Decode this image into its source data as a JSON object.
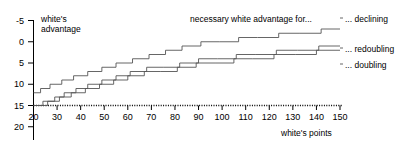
{
  "chart_data": {
    "type": "line",
    "title": "necessary white advantage for...",
    "xlabel": "white's points",
    "ylabel": "white's advantage",
    "xlim": [
      20,
      150
    ],
    "ylim": [
      -5,
      20
    ],
    "grid": false,
    "legend_position": "right",
    "xticks": [
      20,
      30,
      40,
      50,
      60,
      70,
      80,
      90,
      100,
      110,
      120,
      130,
      140,
      150
    ],
    "yticks": [
      -5,
      0,
      5,
      10,
      15,
      20
    ],
    "step_style": "post",
    "series": [
      {
        "name": "... declining",
        "color": "#555555",
        "x": [
          20,
          23,
          27,
          32,
          37,
          43,
          49,
          55,
          62,
          69,
          76,
          83,
          91,
          99,
          107,
          115,
          124,
          133,
          142,
          150
        ],
        "values": [
          3,
          4,
          5,
          6,
          7,
          8,
          9,
          10,
          11,
          12,
          13,
          14,
          15,
          15,
          16,
          16,
          17,
          17,
          18,
          18
        ]
      },
      {
        "name": "... redoubling",
        "color": "#555555",
        "x": [
          20,
          24,
          29,
          33,
          38,
          43,
          49,
          55,
          61,
          68,
          75,
          82,
          90,
          98,
          106,
          114,
          123,
          132,
          141,
          150
        ],
        "values": [
          0,
          1,
          2,
          3,
          4,
          5,
          6,
          7,
          8,
          9,
          9,
          10,
          11,
          11,
          12,
          12,
          13,
          13,
          14,
          14
        ]
      },
      {
        "name": "... doubling",
        "color": "#555555",
        "x": [
          20,
          26,
          31,
          36,
          42,
          48,
          54,
          60,
          67,
          74,
          81,
          89,
          97,
          105,
          113,
          122,
          131,
          140,
          150
        ],
        "values": [
          0,
          1,
          2,
          3,
          4,
          5,
          6,
          7,
          8,
          8,
          9,
          10,
          10,
          11,
          11,
          12,
          12,
          13,
          13
        ]
      }
    ],
    "baseline": {
      "name": "zero-line",
      "value": 0,
      "style": "dotted"
    }
  },
  "axes": {
    "y_title": "white's\nadvantage",
    "y_title_line1": "white's",
    "y_title_line2": "advantage",
    "x_title": "white's points",
    "y_tick_labels": [
      "20",
      "15",
      "10",
      "5",
      "0",
      "-5"
    ],
    "x_tick_labels": [
      "20",
      "30",
      "40",
      "50",
      "60",
      "70",
      "80",
      "90",
      "100",
      "110",
      "120",
      "130",
      "140",
      "150"
    ]
  },
  "header": {
    "title": "necessary white advantage for..."
  },
  "legend": {
    "items": [
      {
        "label": "... declining"
      },
      {
        "label": "... redoubling"
      },
      {
        "label": "... doubling"
      }
    ]
  },
  "colors": {
    "line": "#555555",
    "axis": "#000000",
    "background": "#ffffff"
  }
}
